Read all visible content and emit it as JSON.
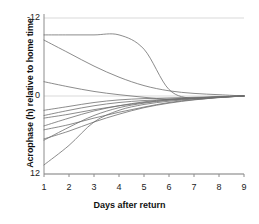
{
  "chart_data": {
    "type": "line",
    "title": "",
    "xlabel": "Days after return",
    "ylabel": "Acrophase (h) relative to home time",
    "x": [
      1,
      2,
      3,
      4,
      5,
      6,
      7,
      8,
      9
    ],
    "xlim": [
      1,
      9
    ],
    "ylim": [
      -12,
      12
    ],
    "y_axis_inverted": true,
    "xticks": [
      "1",
      "2",
      "3",
      "4",
      "5",
      "6",
      "7",
      "8",
      "9"
    ],
    "yticks": [
      "-12",
      "0",
      "12"
    ],
    "grid": true,
    "legend": "none",
    "line_color": "#6f6f6f",
    "series": [
      {
        "name": "subject-1",
        "values": [
          -9.4,
          -9.4,
          -9.4,
          -9.4,
          -7.2,
          -1.0,
          0.4,
          0.2,
          0.0
        ]
      },
      {
        "name": "subject-2",
        "values": [
          -8.6,
          -6.6,
          -4.6,
          -2.9,
          -1.6,
          -0.8,
          -0.4,
          -0.2,
          0.0
        ]
      },
      {
        "name": "subject-3",
        "values": [
          -2.2,
          -1.4,
          -0.7,
          -0.2,
          0.2,
          0.5,
          0.4,
          0.2,
          0.0
        ]
      },
      {
        "name": "subject-4",
        "values": [
          2.2,
          1.6,
          1.0,
          0.6,
          0.4,
          0.3,
          0.2,
          0.1,
          0.0
        ]
      },
      {
        "name": "subject-5",
        "values": [
          3.0,
          2.2,
          1.5,
          1.0,
          0.7,
          0.5,
          0.3,
          0.15,
          0.0
        ]
      },
      {
        "name": "subject-6",
        "values": [
          3.4,
          2.8,
          2.1,
          1.5,
          1.0,
          0.6,
          0.35,
          0.15,
          0.0
        ]
      },
      {
        "name": "subject-7",
        "values": [
          4.6,
          3.4,
          2.3,
          1.5,
          0.9,
          0.5,
          0.3,
          0.12,
          0.0
        ]
      },
      {
        "name": "subject-8",
        "values": [
          5.2,
          4.4,
          3.4,
          2.5,
          1.7,
          1.0,
          0.55,
          0.22,
          0.0
        ]
      },
      {
        "name": "subject-9",
        "values": [
          6.6,
          5.4,
          4.0,
          2.8,
          1.8,
          1.1,
          0.6,
          0.25,
          0.0
        ]
      },
      {
        "name": "subject-10",
        "values": [
          10.6,
          7.6,
          4.0,
          2.2,
          1.3,
          0.8,
          0.45,
          0.18,
          0.0
        ]
      },
      {
        "name": "subject-11",
        "values": [
          6.8,
          4.8,
          3.0,
          1.8,
          1.1,
          0.65,
          0.35,
          0.15,
          0.0
        ]
      }
    ]
  },
  "axes": {
    "ylabel": "Acrophase (h) relative to home time",
    "xlabel": "Days after return",
    "ytick_top": "-12",
    "ytick_mid": "0",
    "ytick_bottom": "12",
    "xtick_1": "1",
    "xtick_2": "2",
    "xtick_3": "3",
    "xtick_4": "4",
    "xtick_5": "5",
    "xtick_6": "6",
    "xtick_7": "7",
    "xtick_8": "8",
    "xtick_9": "9"
  }
}
